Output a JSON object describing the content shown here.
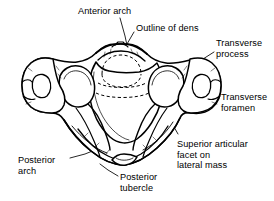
{
  "figure": {
    "background_color": "#ffffff",
    "line_color": "#000000",
    "labels": [
      {
        "id": "anterior-arch",
        "text": "Anterior arch",
        "x": 78,
        "y": 6,
        "align": "left"
      },
      {
        "id": "outline-of-dens",
        "text": "Outline of dens",
        "x": 136,
        "y": 23,
        "align": "left"
      },
      {
        "id": "transverse-process",
        "text": "Transverse\nprocess",
        "x": 216,
        "y": 38,
        "align": "left"
      },
      {
        "id": "transverse-foramen",
        "text": "Transverse\nforamen",
        "x": 221,
        "y": 92,
        "align": "left"
      },
      {
        "id": "superior-articular-facet",
        "text": "Superior articular\nfacet on\nlateral mass",
        "x": 177,
        "y": 139,
        "align": "left"
      },
      {
        "id": "posterior-arch",
        "text": "Posterior\narch",
        "x": 18,
        "y": 155,
        "align": "left"
      },
      {
        "id": "posterior-tubercle",
        "text": "Posterior\ntubercle",
        "x": 120,
        "y": 172,
        "align": "left"
      }
    ],
    "structures": [
      {
        "id": "anterior-arch-structure",
        "name": "anterior arch"
      },
      {
        "id": "dens-outline-structure",
        "name": "outline of dens (dashed)"
      },
      {
        "id": "left-transverse-process",
        "name": "left transverse process"
      },
      {
        "id": "right-transverse-process",
        "name": "right transverse process"
      },
      {
        "id": "left-transverse-foramen",
        "name": "left transverse foramen"
      },
      {
        "id": "right-transverse-foramen",
        "name": "right transverse foramen"
      },
      {
        "id": "left-superior-articular-facet",
        "name": "left superior articular facet"
      },
      {
        "id": "right-superior-articular-facet",
        "name": "right superior articular facet"
      },
      {
        "id": "posterior-arch-structure",
        "name": "posterior arch"
      },
      {
        "id": "posterior-tubercle-structure",
        "name": "posterior tubercle"
      },
      {
        "id": "vertebral-foramen",
        "name": "vertebral foramen"
      }
    ]
  }
}
